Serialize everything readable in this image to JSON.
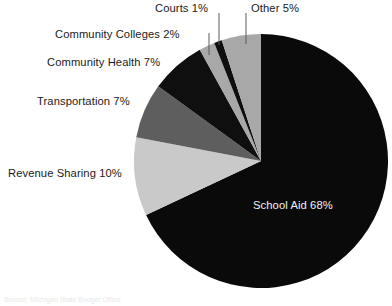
{
  "chart_data": {
    "type": "pie",
    "title": "",
    "subtitle": "",
    "xlabel": "",
    "ylabel": "",
    "legend_position": "none",
    "grid": false,
    "labels_show_percent": true,
    "start_angle_deg": 0,
    "direction": "clockwise",
    "categories": [
      "School Aid",
      "Revenue Sharing",
      "Transportation",
      "Community Health",
      "Community Colleges",
      "Courts",
      "Other"
    ],
    "values": [
      68,
      10,
      7,
      7,
      2,
      1,
      5
    ],
    "slices": [
      {
        "name": "School Aid",
        "label": "School Aid 68%",
        "value": 68,
        "color": "#0a0a0a",
        "label_color": "#f2f2f2",
        "label_placement": "inside",
        "leader_line": false
      },
      {
        "name": "Revenue Sharing",
        "label": "Revenue Sharing 10%",
        "value": 10,
        "color": "#c9c9c9",
        "label_color": "#1a1a1a",
        "label_placement": "outside",
        "leader_line": false
      },
      {
        "name": "Transportation",
        "label": "Transportation 7%",
        "value": 7,
        "color": "#5e5e5e",
        "label_color": "#1a1a1a",
        "label_placement": "outside",
        "leader_line": false
      },
      {
        "name": "Community Health",
        "label": "Community Health 7%",
        "value": 7,
        "color": "#0f0f0f",
        "label_color": "#1a1a1a",
        "label_placement": "outside",
        "leader_line": false
      },
      {
        "name": "Community Colleges",
        "label": "Community Colleges 2%",
        "value": 2,
        "color": "#a8a8a8",
        "label_color": "#1a1a1a",
        "label_placement": "outside",
        "leader_line": true
      },
      {
        "name": "Courts",
        "label": "Courts 1%",
        "value": 1,
        "color": "#0f0f0f",
        "label_color": "#1a1a1a",
        "label_placement": "outside",
        "leader_line": true
      },
      {
        "name": "Other",
        "label": "Other 5%",
        "value": 5,
        "color": "#a8a8a8",
        "label_color": "#1a1a1a",
        "label_placement": "outside",
        "leader_line": true
      }
    ],
    "total": 100
  },
  "caption": {
    "text": "Source: Michigan State Budget Office"
  },
  "colors": {
    "background": "#ffffff",
    "black_slice": "#0a0a0a",
    "light_gray_slice": "#c9c9c9",
    "mid_gray_slice": "#a8a8a8",
    "dark_gray_slice": "#5e5e5e",
    "label_text": "#1a1a1a",
    "inside_label_text": "#f2f2f2",
    "leader_line": "#5a5a5a"
  }
}
